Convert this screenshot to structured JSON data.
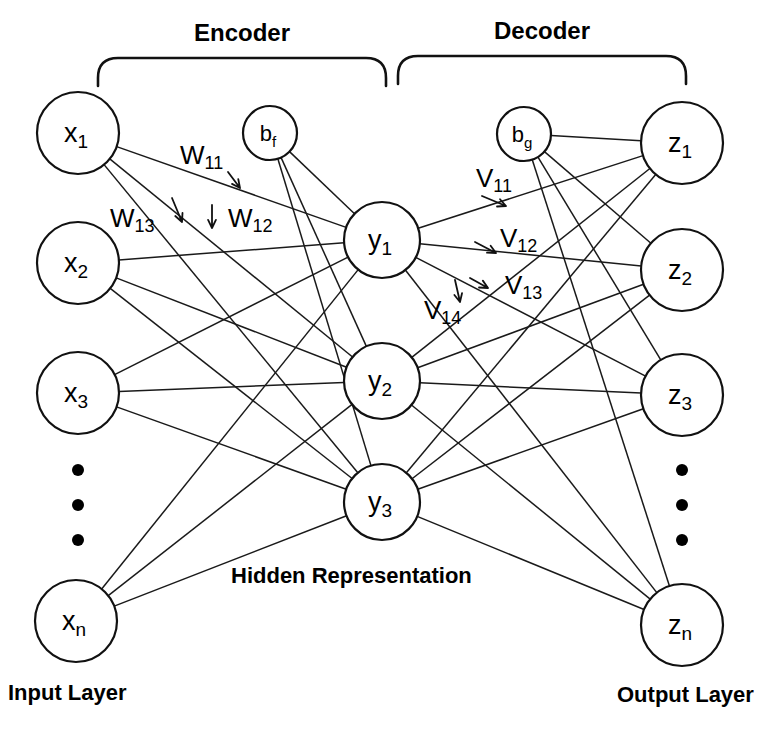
{
  "figure": {
    "type": "diagram",
    "background_color": "#ffffff",
    "stroke_color": "#111111",
    "width": 783,
    "height": 739
  },
  "sections": {
    "encoder_title": "Encoder",
    "decoder_title": "Decoder"
  },
  "captions": {
    "input_layer": "Input Layer",
    "hidden_representation": "Hidden Representation",
    "output_layer": "Output Layer"
  },
  "input_layer": {
    "nodes": [
      {
        "base": "x",
        "sub": "1",
        "cx": 78,
        "cy": 133,
        "r": 41
      },
      {
        "base": "x",
        "sub": "2",
        "cx": 78,
        "cy": 263,
        "r": 41
      },
      {
        "base": "x",
        "sub": "3",
        "cx": 78,
        "cy": 393,
        "r": 41
      },
      {
        "base": "x",
        "sub": "n",
        "cx": 76,
        "cy": 621,
        "r": 41
      }
    ],
    "ellipsis": [
      {
        "cx": 78,
        "cy": 470,
        "r": 6
      },
      {
        "cx": 78,
        "cy": 505,
        "r": 6
      },
      {
        "cx": 78,
        "cy": 540,
        "r": 6
      }
    ]
  },
  "hidden_layer": {
    "nodes": [
      {
        "base": "y",
        "sub": "1",
        "cx": 382,
        "cy": 240,
        "r": 38
      },
      {
        "base": "y",
        "sub": "2",
        "cx": 382,
        "cy": 381,
        "r": 38
      },
      {
        "base": "y",
        "sub": "3",
        "cx": 382,
        "cy": 502,
        "r": 38
      }
    ]
  },
  "output_layer": {
    "nodes": [
      {
        "base": "z",
        "sub": "1",
        "cx": 682,
        "cy": 143,
        "r": 41
      },
      {
        "base": "z",
        "sub": "2",
        "cx": 682,
        "cy": 270,
        "r": 41
      },
      {
        "base": "z",
        "sub": "3",
        "cx": 682,
        "cy": 395,
        "r": 41
      },
      {
        "base": "z",
        "sub": "n",
        "cx": 682,
        "cy": 625,
        "r": 41
      }
    ],
    "ellipsis": [
      {
        "cx": 682,
        "cy": 470,
        "r": 6
      },
      {
        "cx": 682,
        "cy": 505,
        "r": 6
      },
      {
        "cx": 682,
        "cy": 540,
        "r": 6
      }
    ]
  },
  "bias_nodes": [
    {
      "base": "b",
      "sub": "f",
      "cx": 270,
      "cy": 133,
      "r": 27,
      "name": "encoder-bias"
    },
    {
      "base": "b",
      "sub": "g",
      "cx": 524,
      "cy": 134,
      "r": 27,
      "name": "decoder-bias"
    }
  ],
  "weight_labels": [
    {
      "base": "W",
      "sub": "11",
      "x": 180,
      "y": 155,
      "px1": 228,
      "py1": 172,
      "px2": 240,
      "py2": 188,
      "name": "weight-w11"
    },
    {
      "base": "W",
      "sub": "12",
      "x": 228,
      "y": 218,
      "px1": 212,
      "py1": 205,
      "px2": 212,
      "py2": 228,
      "name": "weight-w12"
    },
    {
      "base": "W",
      "sub": "13",
      "x": 110,
      "y": 218,
      "px1": 172,
      "py1": 198,
      "px2": 182,
      "py2": 222,
      "name": "weight-w13"
    },
    {
      "base": "V",
      "sub": "11",
      "x": 476,
      "y": 178,
      "px1": 482,
      "py1": 196,
      "px2": 506,
      "py2": 206,
      "name": "weight-v11"
    },
    {
      "base": "V",
      "sub": "12",
      "x": 500,
      "y": 238,
      "px1": 475,
      "py1": 242,
      "px2": 496,
      "py2": 253,
      "name": "weight-v12"
    },
    {
      "base": "V",
      "sub": "13",
      "x": 505,
      "y": 285,
      "px1": 470,
      "py1": 278,
      "px2": 488,
      "py2": 288,
      "name": "weight-v13"
    },
    {
      "base": "V",
      "sub": "14",
      "x": 424,
      "y": 310,
      "px1": 455,
      "py1": 280,
      "px2": 460,
      "py2": 302,
      "name": "weight-v14"
    }
  ],
  "brackets": {
    "encoder": {
      "x": 98,
      "y": 58,
      "width": 288,
      "height": 28,
      "radius": 20
    },
    "decoder": {
      "x": 398,
      "y": 56,
      "width": 288,
      "height": 28,
      "radius": 20
    }
  },
  "title_positions": {
    "encoder": {
      "x": 242,
      "y": 32
    },
    "decoder": {
      "x": 542,
      "y": 30
    }
  },
  "caption_positions": {
    "input_layer": {
      "x": 8,
      "y": 692
    },
    "hidden_representation": {
      "x": 231,
      "y": 575
    },
    "output_layer": {
      "x": 617,
      "y": 694
    }
  }
}
